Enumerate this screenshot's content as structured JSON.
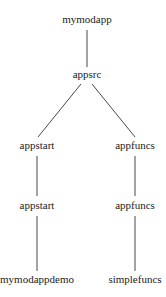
{
  "diagram": {
    "type": "tree",
    "nodes": [
      {
        "id": "n0",
        "label": "mymodapp",
        "x": 87,
        "y": 23
      },
      {
        "id": "n1",
        "label": "appsrc",
        "x": 87,
        "y": 78
      },
      {
        "id": "n2",
        "label": "appstart",
        "x": 37,
        "y": 149
      },
      {
        "id": "n3",
        "label": "appfuncs",
        "x": 135,
        "y": 149
      },
      {
        "id": "n4",
        "label": "appstart",
        "x": 37,
        "y": 209
      },
      {
        "id": "n5",
        "label": "appfuncs",
        "x": 135,
        "y": 209
      },
      {
        "id": "n6",
        "label": "mymodappdemo",
        "x": 37,
        "y": 283
      },
      {
        "id": "n7",
        "label": "simplefuncs",
        "x": 135,
        "y": 283
      }
    ],
    "edges": [
      {
        "from": "mymodapp",
        "to": "appsrc",
        "x1": 87,
        "y1": 30,
        "x2": 87,
        "y2": 67
      },
      {
        "from": "appsrc",
        "to": "appstart",
        "x1": 81,
        "y1": 84,
        "x2": 38,
        "y2": 137
      },
      {
        "from": "appsrc",
        "to": "appfuncs",
        "x1": 92,
        "y1": 84,
        "x2": 135,
        "y2": 137
      },
      {
        "from": "appstart",
        "to": "appstart",
        "x1": 37,
        "y1": 156,
        "x2": 37,
        "y2": 196
      },
      {
        "from": "appfuncs",
        "to": "appfuncs",
        "x1": 135,
        "y1": 156,
        "x2": 135,
        "y2": 196
      },
      {
        "from": "appstart",
        "to": "mymodappdemo",
        "x1": 37,
        "y1": 216,
        "x2": 37,
        "y2": 271
      },
      {
        "from": "appfuncs",
        "to": "simplefuncs",
        "x1": 135,
        "y1": 216,
        "x2": 135,
        "y2": 271
      }
    ]
  }
}
